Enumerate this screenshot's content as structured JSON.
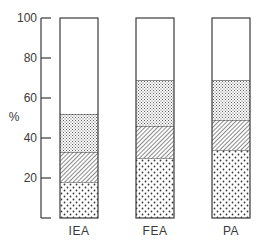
{
  "chart_data": {
    "type": "bar",
    "stacked": true,
    "title": "",
    "xlabel": "",
    "ylabel": "%",
    "ylim": [
      0,
      100
    ],
    "yticks": [
      0,
      20,
      40,
      60,
      80,
      100
    ],
    "ytick_labels": [
      "",
      "20",
      "40",
      "60",
      "80",
      "100"
    ],
    "grid": false,
    "legend": "none",
    "categories": [
      "IEA",
      "FEA",
      "PA"
    ],
    "series": [
      {
        "name": "segment-1 (sparse dots)",
        "pattern": "sparse-dots",
        "values": [
          18,
          30,
          34
        ]
      },
      {
        "name": "segment-2 (diagonal hatch)",
        "pattern": "diagonal-hatch",
        "values": [
          15,
          16,
          15
        ]
      },
      {
        "name": "segment-3 (fine dots)",
        "pattern": "fine-dots",
        "values": [
          19,
          23,
          20
        ]
      },
      {
        "name": "segment-4 (blank)",
        "pattern": "blank",
        "values": [
          48,
          31,
          31
        ]
      }
    ],
    "colors": {
      "ink": "#3a3a3a",
      "background": "#ffffff"
    }
  }
}
